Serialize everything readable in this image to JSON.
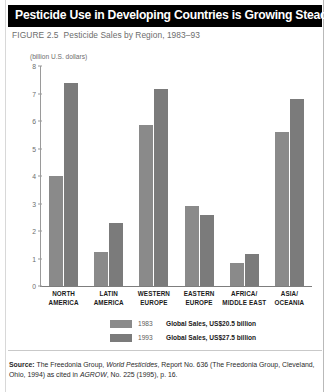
{
  "header": {
    "title": "Pesticide Use in Developing Countries is Growing Steadily"
  },
  "figure": {
    "number": "FIGURE 2.5",
    "caption": "Pesticide Sales by Region, 1983–93"
  },
  "source": {
    "label": "Source:",
    "part1": " The Freedonia Group, ",
    "italic1": "World Pesticides",
    "part2": ", Report No. 636 (The Freedonia Group, Cleveland, Ohio, 1994) as cited in ",
    "italic2": "AGROW",
    "part3": ", No. 225 (1995), p. 16."
  },
  "chart_data": {
    "type": "bar",
    "title": "Pesticide Sales by Region, 1983–93",
    "subtitle": "",
    "xlabel": "",
    "ylabel": "(billion U.S. dollars)",
    "ylim": [
      0,
      8
    ],
    "yticks": [
      "0",
      "1",
      "2",
      "3",
      "4",
      "5",
      "6",
      "7",
      "8"
    ],
    "grid": false,
    "legend_position": "bottom",
    "categories": [
      "NORTH\nAMERICA",
      "LATIN\nAMERICA",
      "WESTERN\nEUROPE",
      "EASTERN\nEUROPE",
      "AFRICA/\nMIDDLE EAST",
      "ASIA/\nOCEANIA"
    ],
    "category_lines": [
      [
        "NORTH",
        "AMERICA"
      ],
      [
        "LATIN",
        "AMERICA"
      ],
      [
        "WESTERN",
        "EUROPE"
      ],
      [
        "EASTERN",
        "EUROPE"
      ],
      [
        "AFRICA/",
        "MIDDLE EAST"
      ],
      [
        "ASIA/",
        "OCEANIA"
      ]
    ],
    "series": [
      {
        "name": "1983",
        "color": "#8a8a8a",
        "legend_note": "Global Sales, US$20.5 billion",
        "values": [
          4.0,
          1.25,
          5.85,
          2.9,
          0.85,
          5.6
        ]
      },
      {
        "name": "1993",
        "color": "#7b7b7b",
        "legend_note": "Global Sales, US$27.5 billion",
        "values": [
          7.4,
          2.3,
          7.15,
          2.6,
          1.15,
          6.8
        ]
      }
    ]
  }
}
